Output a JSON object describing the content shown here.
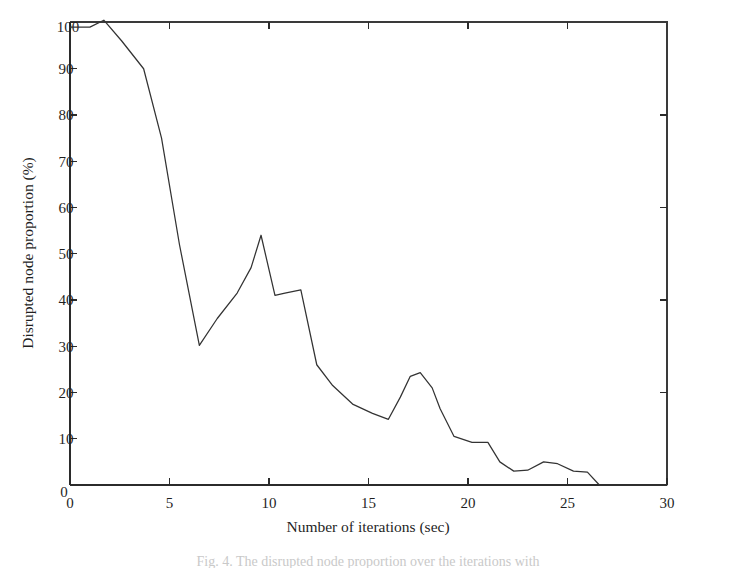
{
  "figure": {
    "background_color": "#ffffff",
    "line_color": "#333333",
    "axis_color": "#2b2b2b",
    "caption": "Fig. 4. The disrupted node proportion over the iterations with"
  },
  "chart_data": {
    "type": "line",
    "title": "",
    "xlabel": "Number of iterations (sec)",
    "ylabel": "Disrupted node proportion (%)",
    "xlim": [
      0,
      30
    ],
    "ylim": [
      0,
      100
    ],
    "xticks": [
      0,
      5,
      10,
      15,
      20,
      25,
      30
    ],
    "xtick_labels": [
      "0",
      "5",
      "10",
      "15",
      "20",
      "25",
      "30"
    ],
    "yticks": [
      0,
      10,
      20,
      30,
      40,
      50,
      60,
      70,
      80,
      90,
      100
    ],
    "ytick_labels": [
      "0",
      "10",
      "20",
      "30",
      "40",
      "50",
      "60",
      "70",
      "80",
      "90",
      "100"
    ],
    "grid": false,
    "legend": false,
    "series": [
      {
        "name": "Disrupted node proportion",
        "color": "#333333",
        "x": [
          0.0,
          1.0,
          1.7,
          2.6,
          3.7,
          4.6,
          5.5,
          6.5,
          7.4,
          8.4,
          9.1,
          9.6,
          10.3,
          10.8,
          11.6,
          12.4,
          13.2,
          14.2,
          15.2,
          16.0,
          16.6,
          17.1,
          17.6,
          18.2,
          18.6,
          19.3,
          20.2,
          21.0,
          21.6,
          22.3,
          23.0,
          23.8,
          24.5,
          25.3,
          26.0,
          26.6,
          30.0
        ],
        "y": [
          99.0,
          99.0,
          100.5,
          96.0,
          90.0,
          75.0,
          52.0,
          30.2,
          36.0,
          41.5,
          47.0,
          54.0,
          41.0,
          41.5,
          42.2,
          26.0,
          21.5,
          17.5,
          15.5,
          14.2,
          19.0,
          23.5,
          24.3,
          21.0,
          16.5,
          10.5,
          9.2,
          9.2,
          5.0,
          3.0,
          3.2,
          5.0,
          4.6,
          3.0,
          2.8,
          0.0,
          0.0
        ]
      }
    ],
    "annotations": []
  },
  "axes": {
    "y_axis_title": "Disrupted node proportion (%)",
    "x_axis_title": "Number of iterations (sec)"
  }
}
